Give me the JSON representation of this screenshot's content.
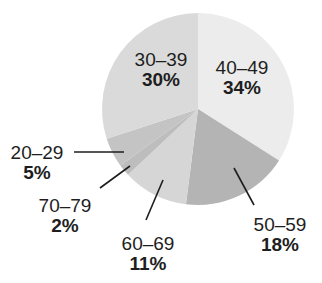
{
  "chart_data": {
    "type": "pie",
    "title": "",
    "categories": [
      "40–49",
      "50–59",
      "60–69",
      "70–79",
      "20–29",
      "30–39"
    ],
    "values": [
      34,
      18,
      11,
      2,
      5,
      30
    ],
    "value_labels": [
      "34%",
      "18%",
      "11%",
      "2%",
      "5%",
      "30%"
    ],
    "colors": [
      "#ececec",
      "#b4b4b4",
      "#d6d6d6",
      "#bdbdbd",
      "#c4c4c4",
      "#dadada"
    ],
    "start_angle": "12 o'clock",
    "direction": "clockwise",
    "legend": "none (labels on/around slices)"
  },
  "labels": {
    "l3039": {
      "cat": "30–39",
      "pct": "30%"
    },
    "l4049": {
      "cat": "40–49",
      "pct": "34%"
    },
    "l2029": {
      "cat": "20–29",
      "pct": "5%"
    },
    "l7079": {
      "cat": "70–79",
      "pct": "2%"
    },
    "l6069": {
      "cat": "60–69",
      "pct": "11%"
    },
    "l5059": {
      "cat": "50–59",
      "pct": "18%"
    }
  }
}
